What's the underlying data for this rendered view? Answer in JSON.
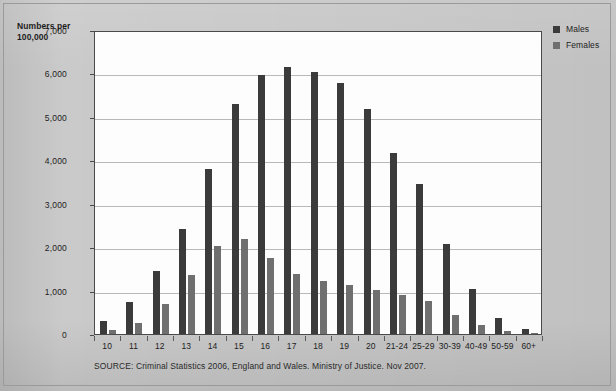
{
  "colors": {
    "page_background": "#c7c7c7",
    "plot_background": "#fdfdfd",
    "males_series": "#3b3b3b",
    "females_series": "#6f6f6f",
    "axis": "#4a4a4a",
    "gridline": "#b9b9b9"
  },
  "axis_title": {
    "line1": "Numbers per",
    "line2": "100,000"
  },
  "legend": {
    "items": [
      {
        "label": "Males",
        "color": "#3b3b3b",
        "swatch": "legend-swatch-males"
      },
      {
        "label": "Females",
        "color": "#6f6f6f",
        "swatch": "legend-swatch-females"
      }
    ]
  },
  "source_note": "SOURCE: Criminal Statistics 2006, England and Wales. Ministry of Justice. Nov 2007.",
  "chart_data": {
    "type": "bar",
    "title": "",
    "subtitle": "",
    "xlabel": "",
    "ylabel": "Numbers per 100,000",
    "ylim": [
      0,
      7000
    ],
    "ytick_labels": [
      "0",
      "1,000",
      "2,000",
      "3,000",
      "4,000",
      "5,000",
      "6,000",
      "7,000"
    ],
    "ytick_values": [
      0,
      1000,
      2000,
      3000,
      4000,
      5000,
      6000,
      7000
    ],
    "grid": true,
    "legend_position": "right",
    "categories": [
      "10",
      "11",
      "12",
      "13",
      "14",
      "15",
      "16",
      "17",
      "18",
      "19",
      "20",
      "21-24",
      "25-29",
      "30-39",
      "40-49",
      "50-59",
      "60+"
    ],
    "series": [
      {
        "name": "Males",
        "color": "#3b3b3b",
        "values": [
          290,
          730,
          1440,
          2420,
          3800,
          5290,
          5970,
          6150,
          6030,
          5770,
          5170,
          4170,
          3460,
          2070,
          1030,
          380,
          110
        ]
      },
      {
        "name": "Females",
        "color": "#6f6f6f",
        "values": [
          90,
          250,
          680,
          1350,
          2020,
          2190,
          1750,
          1390,
          1210,
          1120,
          1020,
          890,
          760,
          440,
          210,
          80,
          30
        ]
      }
    ]
  }
}
